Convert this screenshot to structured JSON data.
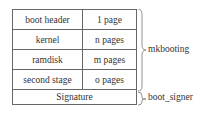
{
  "rows": [
    {
      "name": "boot header",
      "size": "1 page"
    },
    {
      "name": "kernel",
      "size": "n pages"
    },
    {
      "name": "ramdisk",
      "size": "m pages"
    },
    {
      "name": "second stage",
      "size": "o pages"
    }
  ],
  "signature": "Signature",
  "braces": {
    "mkbooting": "mkbooting",
    "boot_signer": "boot_signer"
  }
}
